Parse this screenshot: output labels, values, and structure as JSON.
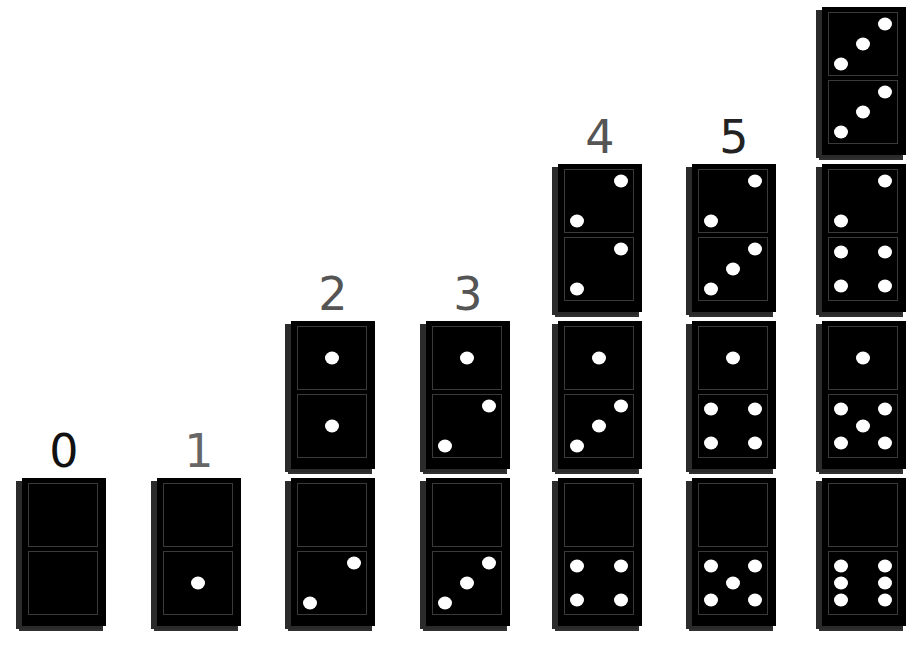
{
  "colors": {
    "background": "#ffffff",
    "domino": "#000000",
    "pip": "#ffffff",
    "label_dark": "#111111",
    "label_gray": "#555555"
  },
  "columns": [
    {
      "label": "0",
      "label_color": "#111111",
      "x": 22,
      "dominoes": [
        [
          0,
          0
        ]
      ]
    },
    {
      "label": "1",
      "label_color": "#666666",
      "x": 157,
      "dominoes": [
        [
          0,
          1
        ]
      ]
    },
    {
      "label": "2",
      "label_color": "#555555",
      "x": 291,
      "dominoes": [
        [
          1,
          1
        ],
        [
          0,
          2
        ]
      ]
    },
    {
      "label": "3",
      "label_color": "#555555",
      "x": 426,
      "dominoes": [
        [
          1,
          2
        ],
        [
          0,
          3
        ]
      ]
    },
    {
      "label": "4",
      "label_color": "#555555",
      "x": 558,
      "dominoes": [
        [
          2,
          2
        ],
        [
          1,
          3
        ],
        [
          0,
          4
        ]
      ]
    },
    {
      "label": "5",
      "label_color": "#222222",
      "x": 692,
      "dominoes": [
        [
          2,
          3
        ],
        [
          1,
          4
        ],
        [
          0,
          5
        ]
      ]
    },
    {
      "label": "",
      "label_color": "#222222",
      "x": 822,
      "dominoes": [
        [
          3,
          3
        ],
        [
          2,
          4
        ],
        [
          1,
          5
        ],
        [
          0,
          6
        ]
      ]
    }
  ]
}
